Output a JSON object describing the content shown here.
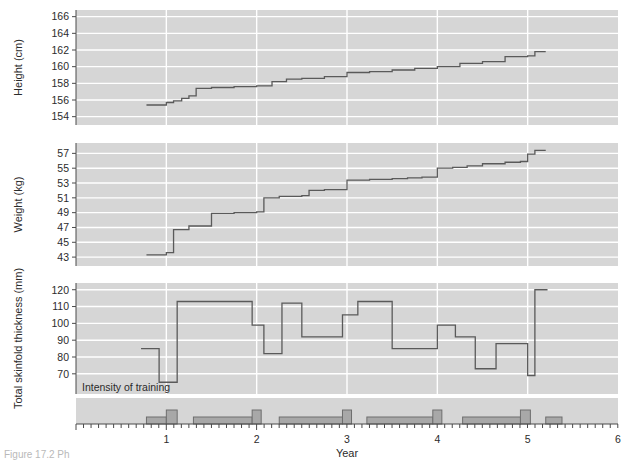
{
  "figure": {
    "caption_fragment": "Figure 17.2  Ph",
    "annotation": "Intensity of training",
    "xaxis": {
      "label": "Year",
      "ticks": [
        0,
        1,
        2,
        3,
        4,
        5,
        6
      ],
      "tick_labels": [
        "",
        "1",
        "2",
        "3",
        "4",
        "5",
        "6"
      ],
      "minor_tick_interval": 0.0833,
      "range": [
        0,
        6
      ]
    },
    "colors": {
      "panel_background": "#d6d6d6",
      "gridline": "#ffffff",
      "trace": "#5a5a5a",
      "bar_fill": "#a8a8a8",
      "bar_edge": "#6e6e6e",
      "axis": "#4a4a4a",
      "text": "#2b2b2b"
    }
  },
  "chart_data": [
    {
      "type": "line",
      "title": "",
      "panel": "height",
      "xlabel": "Year",
      "ylabel": "Height (cm)",
      "ylim": [
        153,
        166.8
      ],
      "yticks": [
        154,
        156,
        158,
        160,
        162,
        164,
        166
      ],
      "xlim": [
        0,
        6
      ],
      "grid": true,
      "drawstyle": "steps-post",
      "x": [
        0.78,
        0.92,
        1.0,
        1.08,
        1.17,
        1.25,
        1.33,
        1.5,
        1.75,
        2.0,
        2.17,
        2.33,
        2.5,
        2.75,
        3.0,
        3.25,
        3.5,
        3.75,
        4.0,
        4.25,
        4.5,
        4.75,
        5.0,
        5.08,
        5.2
      ],
      "y": [
        155.4,
        155.4,
        155.7,
        155.9,
        156.2,
        156.5,
        157.4,
        157.5,
        157.6,
        157.7,
        158.2,
        158.5,
        158.6,
        158.8,
        159.3,
        159.4,
        159.6,
        159.8,
        160.0,
        160.4,
        160.6,
        161.2,
        161.3,
        161.8,
        161.8
      ]
    },
    {
      "type": "line",
      "title": "",
      "panel": "weight",
      "xlabel": "Year",
      "ylabel": "Weight (kg)",
      "ylim": [
        41.8,
        58.4
      ],
      "yticks": [
        43,
        45,
        47,
        49,
        51,
        53,
        55,
        57
      ],
      "xlim": [
        0,
        6
      ],
      "grid": true,
      "drawstyle": "steps-post",
      "x": [
        0.78,
        0.9,
        1.0,
        1.08,
        1.25,
        1.5,
        1.75,
        2.0,
        2.08,
        2.25,
        2.5,
        2.58,
        2.75,
        3.0,
        3.25,
        3.5,
        3.67,
        3.83,
        4.0,
        4.17,
        4.33,
        4.5,
        4.75,
        4.92,
        5.0,
        5.08,
        5.2
      ],
      "y": [
        43.3,
        43.3,
        43.6,
        46.7,
        47.2,
        48.9,
        49.0,
        49.1,
        51.0,
        51.2,
        51.3,
        52.0,
        52.1,
        53.4,
        53.5,
        53.6,
        53.7,
        53.8,
        55.0,
        55.1,
        55.3,
        55.6,
        55.8,
        55.9,
        56.9,
        57.4,
        57.4
      ]
    },
    {
      "type": "line",
      "title": "",
      "panel": "skinfold",
      "xlabel": "Year",
      "ylabel": "Total skinfold thickness (mm)",
      "ylim": [
        58,
        124
      ],
      "yticks": [
        70,
        80,
        90,
        100,
        110,
        120
      ],
      "xlim": [
        0,
        6
      ],
      "grid": true,
      "drawstyle": "steps-post",
      "x": [
        0.72,
        0.88,
        0.92,
        1.02,
        1.12,
        1.22,
        1.95,
        2.0,
        2.08,
        2.12,
        2.28,
        2.38,
        2.5,
        2.62,
        2.95,
        3.0,
        3.08,
        3.12,
        3.3,
        3.5,
        4.0,
        4.08,
        4.2,
        4.3,
        4.42,
        4.55,
        4.65,
        4.92,
        5.0,
        5.08,
        5.22
      ],
      "y": [
        85,
        85,
        65,
        65,
        113,
        113,
        99,
        99,
        82,
        82,
        112,
        112,
        92,
        92,
        105,
        105,
        105,
        113,
        113,
        85,
        99,
        99,
        92,
        92,
        73,
        73,
        88,
        88,
        69,
        120,
        120
      ]
    },
    {
      "type": "bar",
      "title": "",
      "panel": "intensity_of_training",
      "xlabel": "Year",
      "ylabel": "",
      "ylim": [
        0,
        3
      ],
      "xlim": [
        0,
        6
      ],
      "grid": false,
      "bars": [
        {
          "x0": 0.78,
          "x1": 1.0,
          "height": 1
        },
        {
          "x0": 1.0,
          "x1": 1.12,
          "height": 2
        },
        {
          "x0": 1.3,
          "x1": 1.95,
          "height": 1
        },
        {
          "x0": 1.95,
          "x1": 2.05,
          "height": 2
        },
        {
          "x0": 2.25,
          "x1": 2.95,
          "height": 1
        },
        {
          "x0": 2.95,
          "x1": 3.05,
          "height": 2
        },
        {
          "x0": 3.22,
          "x1": 3.95,
          "height": 1
        },
        {
          "x0": 3.95,
          "x1": 4.05,
          "height": 2
        },
        {
          "x0": 4.28,
          "x1": 4.92,
          "height": 1
        },
        {
          "x0": 4.92,
          "x1": 5.03,
          "height": 2
        },
        {
          "x0": 5.2,
          "x1": 5.38,
          "height": 1
        }
      ]
    }
  ]
}
